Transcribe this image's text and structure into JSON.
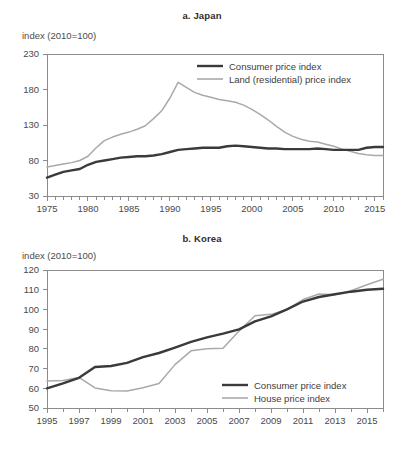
{
  "figure": {
    "axis_caption": "index (2010=100)",
    "colors": {
      "cpi": "#3a3a3a",
      "asset": "#a9a9a9",
      "axis": "#8c8c8c",
      "text": "#4a4a4a"
    }
  },
  "panels": {
    "japan": {
      "title": "a. Japan",
      "axis_caption": "index (2010=100)",
      "legend": [
        {
          "label": "Consumer price index",
          "color": "#3a3a3a",
          "width": 2.4
        },
        {
          "label": "Land (residential) price index",
          "color": "#a9a9a9",
          "width": 1.6
        }
      ]
    },
    "korea": {
      "title": "b. Korea",
      "axis_caption": "index (2010=100)",
      "legend": [
        {
          "label": "Consumer price index",
          "color": "#3a3a3a",
          "width": 2.4
        },
        {
          "label": "House price index",
          "color": "#a9a9a9",
          "width": 1.6
        }
      ]
    }
  },
  "chart_data": [
    {
      "type": "line",
      "title": "a. Japan",
      "xlabel": "",
      "ylabel": "index (2010=100)",
      "xlim": [
        1975,
        2016
      ],
      "ylim": [
        30,
        230
      ],
      "ytick_labels": [
        30,
        80,
        130,
        180,
        230
      ],
      "xtick_labels": [
        1975,
        1980,
        1985,
        1990,
        1995,
        2000,
        2005,
        2010,
        2015
      ],
      "xtick_step_minor": 1,
      "grid": false,
      "legend_position": "top-right",
      "x": [
        1975,
        1976,
        1977,
        1978,
        1979,
        1980,
        1981,
        1982,
        1983,
        1984,
        1985,
        1986,
        1987,
        1988,
        1989,
        1990,
        1991,
        1992,
        1993,
        1994,
        1995,
        1996,
        1997,
        1998,
        1999,
        2000,
        2001,
        2002,
        2003,
        2004,
        2005,
        2006,
        2007,
        2008,
        2009,
        2010,
        2011,
        2012,
        2013,
        2014,
        2015,
        2016
      ],
      "series": [
        {
          "name": "Consumer price index",
          "color": "#3a3a3a",
          "values": [
            56,
            60,
            64,
            66,
            68,
            74,
            78,
            80,
            82,
            84,
            85,
            86,
            86,
            87,
            89,
            92,
            95,
            96,
            97,
            98,
            98,
            98,
            100,
            101,
            100,
            99,
            98,
            97,
            97,
            96,
            96,
            96,
            96,
            97,
            96,
            95,
            95,
            95,
            95,
            98,
            99,
            99
          ]
        },
        {
          "name": "Land (residential) price index",
          "color": "#a9a9a9",
          "values": [
            71,
            73,
            75,
            77,
            80,
            86,
            98,
            108,
            113,
            117,
            120,
            124,
            129,
            139,
            150,
            168,
            190,
            183,
            176,
            172,
            169,
            166,
            164,
            162,
            158,
            152,
            145,
            137,
            128,
            120,
            114,
            110,
            107,
            106,
            103,
            100,
            96,
            93,
            90,
            88,
            87,
            87
          ]
        }
      ]
    },
    {
      "type": "line",
      "title": "b. Korea",
      "xlabel": "",
      "ylabel": "index (2010=100)",
      "xlim": [
        1995,
        2016
      ],
      "ylim": [
        50,
        120
      ],
      "ytick_labels": [
        50,
        60,
        70,
        80,
        90,
        100,
        110,
        120
      ],
      "xtick_labels": [
        1995,
        1997,
        1999,
        2001,
        2003,
        2005,
        2007,
        2009,
        2011,
        2013,
        2015
      ],
      "xtick_step_minor": 1,
      "grid": false,
      "legend_position": "bottom-right",
      "x": [
        1995,
        1996,
        1997,
        1998,
        1999,
        2000,
        2001,
        2002,
        2003,
        2004,
        2005,
        2006,
        2007,
        2008,
        2009,
        2010,
        2011,
        2012,
        2013,
        2014,
        2015,
        2016
      ],
      "series": [
        {
          "name": "Consumer price index",
          "color": "#3a3a3a",
          "values": [
            60.0,
            62.5,
            65.3,
            70.8,
            71.3,
            72.9,
            75.8,
            77.9,
            80.6,
            83.5,
            85.8,
            87.7,
            89.9,
            93.9,
            96.5,
            100.0,
            104.0,
            106.3,
            107.7,
            109.0,
            110.0,
            110.5
          ]
        },
        {
          "name": "House price index",
          "color": "#a9a9a9",
          "values": [
            63.7,
            63.9,
            65.5,
            60.2,
            58.7,
            58.6,
            60.3,
            62.4,
            72.0,
            79.0,
            80.1,
            80.3,
            89.0,
            96.8,
            97.5,
            100.0,
            105.0,
            107.8,
            107.5,
            109.5,
            112.5,
            115.3
          ]
        }
      ]
    }
  ]
}
